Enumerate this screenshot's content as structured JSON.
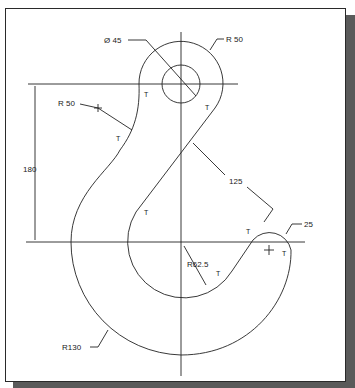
{
  "drawing": {
    "title": "Crane hook profile",
    "dimensions": {
      "hole_diameter": "Ø 45",
      "top_radius": "R 50",
      "left_fillet_radius": "R 50",
      "height": "180",
      "slant_length": "125",
      "tip_radius": "25",
      "inner_radius": "R62.5",
      "outer_radius": "R130"
    },
    "tangent_marker": "T",
    "colors": {
      "line": "#222222",
      "paper": "#ffffff",
      "shadow": "#5a5a5a"
    }
  }
}
